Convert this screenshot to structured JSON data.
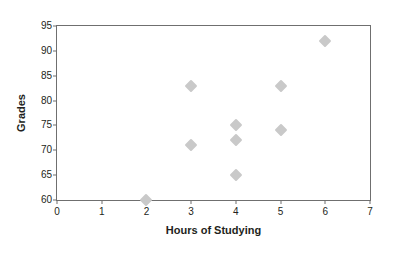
{
  "chart_data": {
    "type": "scatter",
    "title": "",
    "xlabel": "Hours of Studying",
    "ylabel": "Grades",
    "xlim": [
      0,
      7
    ],
    "ylim": [
      60,
      95
    ],
    "xticks": [
      0,
      1,
      2,
      3,
      4,
      5,
      6,
      7
    ],
    "yticks": [
      60,
      65,
      70,
      75,
      80,
      85,
      90,
      95
    ],
    "grid": false,
    "legend": null,
    "series": [
      {
        "name": "Students",
        "marker": "diamond",
        "color": "#c9c9c9",
        "points": [
          {
            "x": 2,
            "y": 60
          },
          {
            "x": 3,
            "y": 83
          },
          {
            "x": 3,
            "y": 71
          },
          {
            "x": 4,
            "y": 75
          },
          {
            "x": 4,
            "y": 72
          },
          {
            "x": 4,
            "y": 65
          },
          {
            "x": 5,
            "y": 83
          },
          {
            "x": 5,
            "y": 74
          },
          {
            "x": 6,
            "y": 92
          }
        ]
      }
    ]
  },
  "style": {
    "frame_color": "#6f6f6f",
    "text_color": "#231f20",
    "background": "#ffffff"
  }
}
